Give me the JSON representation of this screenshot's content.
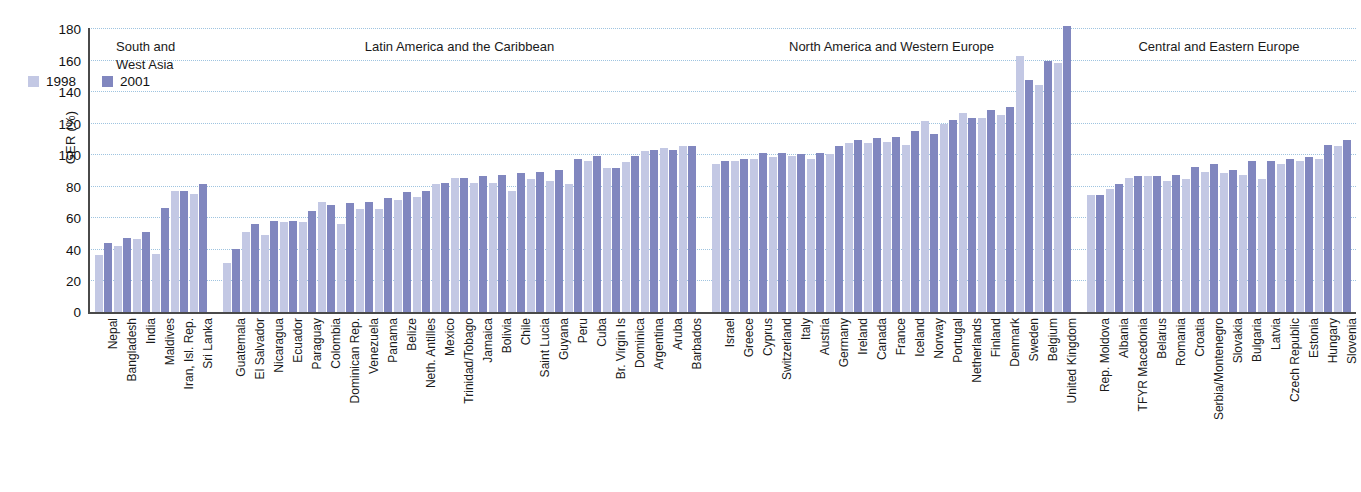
{
  "chart_data": {
    "type": "bar",
    "title": "",
    "xlabel": "",
    "ylabel": "GER (%)",
    "ylim": [
      0,
      180
    ],
    "yticks": [
      0,
      20,
      40,
      60,
      80,
      100,
      120,
      140,
      160,
      180
    ],
    "grid": true,
    "legend_position": "top-left",
    "series": [
      {
        "name": "1998",
        "color": "#c3c8e4"
      },
      {
        "name": "2001",
        "color": "#8187bf"
      }
    ],
    "regions": [
      {
        "name": "South and\nWest Asia",
        "categories": [
          "Nepal",
          "Bangladesh",
          "India",
          "Maldives",
          "Iran, Isl. Rep.",
          "Sri Lanka"
        ],
        "values_1998": [
          36,
          42,
          46,
          37,
          77,
          75
        ],
        "values_2001": [
          44,
          47,
          51,
          66,
          77,
          81
        ]
      },
      {
        "name": "Latin America and the Caribbean",
        "categories": [
          "Guatemala",
          "El Salvador",
          "Nicaragua",
          "Ecuador",
          "Paraguay",
          "Colombia",
          "Dominican Rep.",
          "Venezuela",
          "Panama",
          "Belize",
          "Neth. Antilles",
          "Mexico",
          "Trinidad/Tobago",
          "Jamaica",
          "Bolivia",
          "Chile",
          "Saint Lucia",
          "Guyana",
          "Peru",
          "Cuba",
          "Br. Virgin Is",
          "Dominica",
          "Argentina",
          "Aruba",
          "Barbados"
        ],
        "values_1998": [
          31,
          51,
          49,
          57,
          57,
          70,
          56,
          65,
          65,
          71,
          73,
          81,
          85,
          82,
          82,
          77,
          84,
          83,
          81,
          96,
          91,
          95,
          102,
          104,
          105
        ],
        "values_2001": [
          40,
          56,
          58,
          58,
          64,
          68,
          69,
          70,
          72,
          76,
          77,
          82,
          85,
          86,
          87,
          88,
          89,
          90,
          97,
          99,
          91,
          99,
          103,
          103,
          105
        ]
      },
      {
        "name": "North America and Western Europe",
        "categories": [
          "Israel",
          "Greece",
          "Cyprus",
          "Switzerland",
          "Italy",
          "Austria",
          "Germany",
          "Ireland",
          "Canada",
          "France",
          "Iceland",
          "Norway",
          "Portugal",
          "Netherlands",
          "Finland",
          "Denmark",
          "Sweden",
          "Belgium",
          "United Kingdom"
        ],
        "values_1998": [
          94,
          96,
          97,
          98,
          99,
          97,
          100,
          107,
          107,
          108,
          106,
          121,
          119,
          126,
          123,
          125,
          162,
          144,
          158
        ],
        "values_2001": [
          96,
          97,
          101,
          101,
          100,
          101,
          105,
          109,
          110,
          111,
          115,
          113,
          122,
          123,
          128,
          130,
          147,
          159,
          181
        ]
      },
      {
        "name": "Central and Eastern Europe",
        "categories": [
          "Rep. Moldova",
          "Albania",
          "TFYR Macedonia",
          "Belarus",
          "Romania",
          "Croatia",
          "Serbia/Montenegro",
          "Slovakia",
          "Bulgaria",
          "Latvia",
          "Czech Republic",
          "Estonia",
          "Hungary",
          "Slovenia"
        ],
        "values_1998": [
          74,
          78,
          85,
          86,
          83,
          84,
          89,
          88,
          87,
          84,
          94,
          96,
          97,
          105
        ],
        "values_2001": [
          74,
          81,
          86,
          86,
          87,
          92,
          94,
          90,
          96,
          96,
          97,
          98,
          106,
          109
        ]
      }
    ]
  },
  "legend": {
    "items": [
      {
        "label": "1998",
        "color": "#c3c8e4"
      },
      {
        "label": "2001",
        "color": "#8187bf"
      }
    ]
  },
  "axes": {
    "y_title": "GER (%)"
  },
  "footnote": ""
}
